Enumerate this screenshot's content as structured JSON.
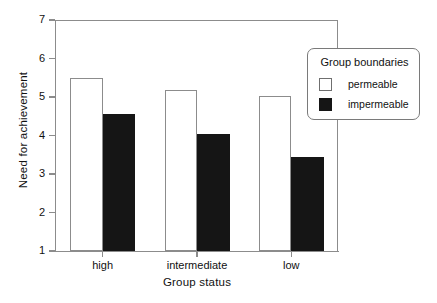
{
  "chart_data": {
    "type": "bar",
    "title": "",
    "xlabel": "Group status",
    "ylabel": "Need for achievement",
    "categories": [
      "high",
      "intermediate",
      "low"
    ],
    "series": [
      {
        "name": "permeable",
        "values": [
          5.5,
          5.17,
          5.02
        ],
        "color": "#ffffff"
      },
      {
        "name": "impermeable",
        "values": [
          4.55,
          4.05,
          3.45
        ],
        "color": "#151515"
      }
    ],
    "ylim": [
      1,
      7
    ],
    "yticks": [
      1,
      2,
      3,
      4,
      5,
      6,
      7
    ],
    "ytick_labels": [
      "1",
      "2",
      "3",
      "4",
      "5",
      "6",
      "7"
    ],
    "grid": false,
    "legend": {
      "title": "Group boundaries",
      "position": "top-right",
      "entries": [
        {
          "label": "permeable",
          "swatch": "white-square"
        },
        {
          "label": "impermeable",
          "swatch": "black-square"
        }
      ]
    }
  },
  "axes": {
    "y_title": "Need for achievement",
    "x_title": "Group status"
  }
}
